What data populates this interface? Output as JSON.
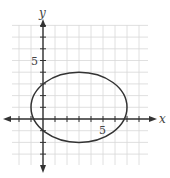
{
  "graph": {
    "axes": {
      "x_label": "x",
      "y_label": "y",
      "x_tick_label": "5",
      "y_tick_label": "5",
      "x_range": [
        -3,
        9
      ],
      "y_range": [
        -3,
        8
      ]
    },
    "ellipse": {
      "equation": "(x-3)^2/16 + (y-1)^2/9 = 1",
      "center": [
        3,
        1
      ],
      "semi_major_x": 4,
      "semi_minor_y": 3
    },
    "colors": {
      "grid": "#d8d8d8",
      "axis": "#333333",
      "curve": "#333333"
    }
  }
}
